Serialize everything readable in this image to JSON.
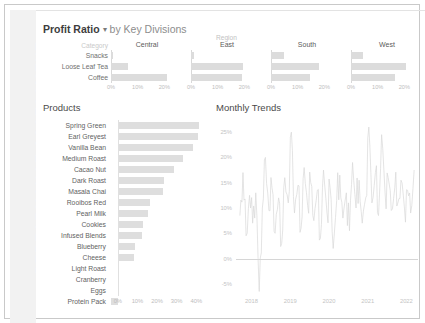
{
  "watermark": {
    "text": "PERFORMANCE ASSESSMENT"
  },
  "header": {
    "title": "Profit Ratio",
    "caret": "▾",
    "subtitle": "by Key Divisions"
  },
  "region_panel": {
    "region_label": "Region",
    "category_header": "Category",
    "categories": [
      "Snacks",
      "Loose Leaf Tea",
      "Coffee"
    ],
    "axis_ticks": [
      "0%",
      "10%",
      "20%"
    ],
    "axis_max": 27,
    "regions": [
      {
        "name": "Central",
        "values": [
          0.7,
          6.2,
          21.0
        ]
      },
      {
        "name": "East",
        "values": [
          1.0,
          19.5,
          19.0
        ]
      },
      {
        "name": "South",
        "values": [
          5.0,
          18.0,
          14.5
        ]
      },
      {
        "name": "West",
        "values": [
          4.6,
          20.5,
          16.5
        ]
      }
    ]
  },
  "products_panel": {
    "title": "Products",
    "axis_ticks": [
      "0%",
      "10%",
      "20%",
      "30%",
      "40%"
    ],
    "axis_min": -4,
    "axis_max": 46,
    "items": [
      {
        "label": "Spring Green",
        "value": 41.5
      },
      {
        "label": "Earl Greyest",
        "value": 40.8
      },
      {
        "label": "Vanilla Bean",
        "value": 38.5
      },
      {
        "label": "Medium Roast",
        "value": 33.0
      },
      {
        "label": "Cacao Nut",
        "value": 28.5
      },
      {
        "label": "Dark Roast",
        "value": 23.5
      },
      {
        "label": "Masala Chai",
        "value": 23.0
      },
      {
        "label": "Rooibos Red",
        "value": 16.5
      },
      {
        "label": "Pearl Milk",
        "value": 15.5
      },
      {
        "label": "Cookies",
        "value": 13.0
      },
      {
        "label": "Infused Blends",
        "value": 12.5
      },
      {
        "label": "Blueberry",
        "value": 9.0
      },
      {
        "label": "Cheese",
        "value": 8.5
      },
      {
        "label": "Light Roast",
        "value": 0.6
      },
      {
        "label": "Cranberry",
        "value": 0.5
      },
      {
        "label": "Eggs",
        "value": 0.4
      },
      {
        "label": "Protein Pack",
        "value": -3.4
      }
    ]
  },
  "trends_panel": {
    "title": "Monthly Trends",
    "y_ticks": [
      "25%",
      "20%",
      "15%",
      "10%",
      "5%",
      "0%",
      "-5%"
    ],
    "y_min": -7,
    "y_max": 27,
    "x_ticks": [
      "2018",
      "2019",
      "2020",
      "2021",
      "2022"
    ],
    "x_min": 2017.6,
    "x_max": 2022.3,
    "line_color": "#d9d9d9"
  },
  "chart_data": [
    {
      "type": "bar",
      "title": "Profit Ratio by Key Divisions",
      "orientation": "horizontal",
      "xlabel": "Profit Ratio",
      "ylabel": "Category",
      "categories": [
        "Snacks",
        "Loose Leaf Tea",
        "Coffee"
      ],
      "xlim": [
        0,
        27
      ],
      "grid": false,
      "legend": "none",
      "series": [
        {
          "name": "Central",
          "values": [
            0.7,
            6.2,
            21.0
          ]
        },
        {
          "name": "East",
          "values": [
            1.0,
            19.5,
            19.0
          ]
        },
        {
          "name": "South",
          "values": [
            5.0,
            18.0,
            14.5
          ]
        },
        {
          "name": "West",
          "values": [
            4.6,
            20.5,
            16.5
          ]
        }
      ]
    },
    {
      "type": "bar",
      "title": "Products",
      "orientation": "horizontal",
      "xlabel": "Profit Ratio",
      "ylabel": "",
      "xlim": [
        -4,
        46
      ],
      "grid": false,
      "legend": "none",
      "categories": [
        "Spring Green",
        "Earl Greyest",
        "Vanilla Bean",
        "Medium Roast",
        "Cacao Nut",
        "Dark Roast",
        "Masala Chai",
        "Rooibos Red",
        "Pearl Milk",
        "Cookies",
        "Infused Blends",
        "Blueberry",
        "Cheese",
        "Light Roast",
        "Cranberry",
        "Eggs",
        "Protein Pack"
      ],
      "values": [
        41.5,
        40.8,
        38.5,
        33.0,
        28.5,
        23.5,
        23.0,
        16.5,
        15.5,
        13.0,
        12.5,
        9.0,
        8.5,
        0.6,
        0.5,
        0.4,
        -3.4
      ]
    },
    {
      "type": "line",
      "title": "Monthly Trends",
      "xlabel": "",
      "ylabel": "Profit Ratio",
      "xlim": [
        2017.6,
        2022.3
      ],
      "ylim": [
        -7,
        27
      ],
      "grid": false,
      "legend": "none",
      "x": [
        2017.7,
        2017.78,
        2017.86,
        2017.95,
        2018.03,
        2018.11,
        2018.2,
        2018.28,
        2018.36,
        2018.45,
        2018.53,
        2018.61,
        2018.7,
        2018.78,
        2018.86,
        2018.95,
        2019.03,
        2019.11,
        2019.2,
        2019.28,
        2019.36,
        2019.45,
        2019.53,
        2019.61,
        2019.7,
        2019.78,
        2019.86,
        2019.95,
        2020.03,
        2020.11,
        2020.2,
        2020.28,
        2020.36,
        2020.45,
        2020.53,
        2020.61,
        2020.7,
        2020.78,
        2020.86,
        2020.95,
        2021.03,
        2021.11,
        2021.2,
        2021.28,
        2021.36,
        2021.45,
        2021.53,
        2021.61,
        2021.7,
        2021.78,
        2021.86,
        2021.95,
        2022.03,
        2022.11,
        2022.2
      ],
      "y": [
        8.5,
        17.0,
        4.5,
        12.5,
        7.0,
        13.0,
        -6.5,
        10.0,
        20.0,
        9.5,
        14.0,
        5.0,
        12.0,
        3.0,
        16.0,
        11.0,
        25.0,
        9.0,
        14.5,
        6.0,
        18.0,
        10.5,
        15.0,
        7.5,
        13.5,
        4.0,
        17.5,
        9.0,
        14.0,
        2.0,
        11.5,
        16.5,
        8.0,
        13.0,
        5.5,
        19.0,
        10.0,
        15.5,
        7.0,
        12.0,
        26.0,
        11.0,
        17.0,
        8.5,
        24.5,
        13.0,
        16.0,
        9.5,
        14.0,
        11.0,
        15.5,
        10.0,
        13.5,
        9.0,
        17.5
      ]
    }
  ]
}
